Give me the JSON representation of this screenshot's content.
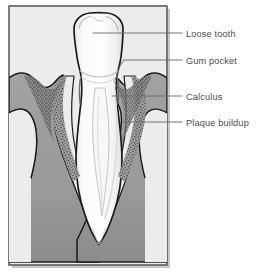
{
  "figure": {
    "frame": {
      "border_color": "#5a5a5a",
      "background_color": "#ececec",
      "shadow_color": "#b8b8b8"
    },
    "colors": {
      "page_background": "#ffffff",
      "tooth_fill": "#fbfbfb",
      "tooth_inner_fill": "#f3f3f3",
      "gum_fill": "#9a9a9a",
      "gum_shadow": "#8e8e8e",
      "calculus_stipple": "#2e2e2e",
      "outline": "#1b1b1b",
      "leader_line": "#6f6f6f",
      "label_text": "#4a4a4a"
    },
    "labels": [
      {
        "id": "loose-tooth",
        "text": "Loose tooth",
        "anchor_x": 93,
        "anchor_y": 33,
        "text_x": 186,
        "text_y": 36
      },
      {
        "id": "gum-pocket",
        "text": "Gum pocket",
        "anchor_x": 115,
        "anchor_y": 80,
        "text_x": 186,
        "text_y": 61
      },
      {
        "id": "calculus",
        "text": "Calculus",
        "anchor_x": 112,
        "anchor_y": 96,
        "text_x": 186,
        "text_y": 98
      },
      {
        "id": "plaque-buildup",
        "text": "Plaque buildup",
        "anchor_x": 123,
        "anchor_y": 122,
        "text_x": 186,
        "text_y": 124
      }
    ],
    "parts": [
      {
        "id": "tooth-crown",
        "name": "Tooth crown"
      },
      {
        "id": "tooth-root",
        "name": "Tooth root"
      },
      {
        "id": "gum-left",
        "name": "Left gum tissue"
      },
      {
        "id": "gum-right",
        "name": "Right gum tissue"
      },
      {
        "id": "calculus-left",
        "name": "Left calculus deposit"
      },
      {
        "id": "calculus-right",
        "name": "Right calculus deposit"
      },
      {
        "id": "pulp-canal",
        "name": "Pulp canal"
      }
    ]
  }
}
